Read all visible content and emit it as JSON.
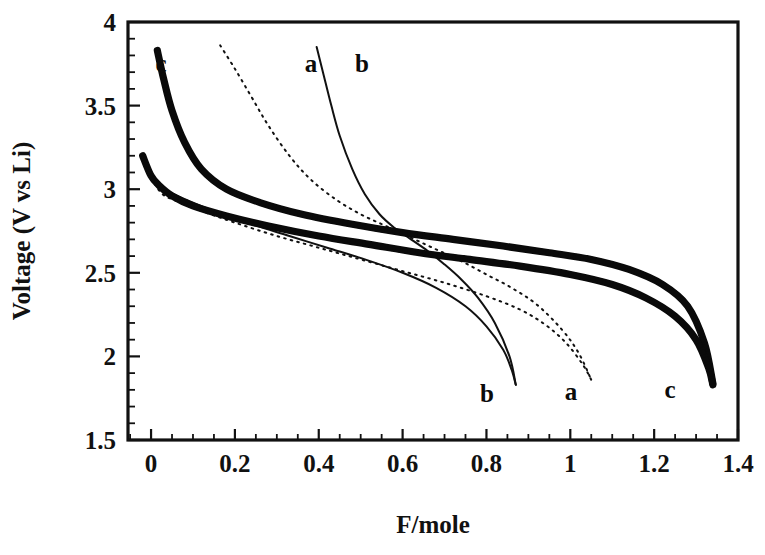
{
  "figure": {
    "title": "",
    "background": "#ffffff",
    "ink_color": "#111111"
  },
  "axes": {
    "x_title": "F/mole",
    "y_title": "Voltage (V vs Li)",
    "x_ticks": [
      "0",
      "0.2",
      "0.4",
      "0.6",
      "0.8",
      "1",
      "1.2",
      "1.4"
    ],
    "y_ticks": [
      "1.5",
      "2",
      "2.5",
      "3",
      "3.5",
      "4"
    ]
  },
  "curve_labels": {
    "c_top": "c",
    "a_top": "a",
    "b_top": "b",
    "b_bottom": "b",
    "a_bottom": "a",
    "c_bottom": "c"
  },
  "chart_data": {
    "type": "line",
    "title": "",
    "xlabel": "F/mole",
    "ylabel": "Voltage (V vs Li)",
    "xlim": [
      -0.055,
      1.4
    ],
    "ylim": [
      1.5,
      4.0
    ],
    "xticks": [
      0,
      0.2,
      0.4,
      0.6,
      0.8,
      1.0,
      1.2,
      1.4
    ],
    "yticks": [
      1.5,
      2.0,
      2.5,
      3.0,
      3.5,
      4.0
    ],
    "x_minor_step": 0.05,
    "y_minor_step": 0.1,
    "grid": false,
    "legend": "inline-curve-labels",
    "series": [
      {
        "name": "a-charge",
        "label": "a",
        "style": "dotted",
        "branch": "charge",
        "x": [
          0.165,
          0.2,
          0.24,
          0.28,
          0.33,
          0.38,
          0.44,
          0.5,
          0.56,
          0.62,
          0.68,
          0.74,
          0.8,
          0.86,
          0.92,
          0.98,
          1.02,
          1.05
        ],
        "y": [
          3.86,
          3.72,
          3.55,
          3.38,
          3.2,
          3.06,
          2.94,
          2.85,
          2.78,
          2.71,
          2.64,
          2.57,
          2.49,
          2.41,
          2.31,
          2.16,
          2.02,
          1.86
        ]
      },
      {
        "name": "a-discharge",
        "label": "a",
        "style": "dotted",
        "branch": "discharge",
        "x": [
          -0.02,
          0.02,
          0.06,
          0.12,
          0.2,
          0.3,
          0.4,
          0.5,
          0.6,
          0.7,
          0.8,
          0.88,
          0.94,
          0.99,
          1.03,
          1.05
        ],
        "y": [
          3.18,
          2.99,
          2.93,
          2.87,
          2.8,
          2.72,
          2.65,
          2.58,
          2.51,
          2.44,
          2.36,
          2.28,
          2.19,
          2.08,
          1.95,
          1.86
        ]
      },
      {
        "name": "b-charge",
        "label": "b",
        "style": "solid-thin",
        "branch": "charge",
        "x": [
          0.395,
          0.41,
          0.43,
          0.45,
          0.48,
          0.51,
          0.545,
          0.58,
          0.62,
          0.66,
          0.7,
          0.74,
          0.78,
          0.82,
          0.855,
          0.87
        ],
        "y": [
          3.85,
          3.7,
          3.5,
          3.32,
          3.12,
          2.97,
          2.85,
          2.77,
          2.7,
          2.63,
          2.55,
          2.46,
          2.35,
          2.2,
          2.0,
          1.83
        ]
      },
      {
        "name": "b-discharge",
        "label": "b",
        "style": "solid-thin",
        "branch": "discharge",
        "x": [
          -0.02,
          0.01,
          0.04,
          0.09,
          0.16,
          0.24,
          0.33,
          0.42,
          0.51,
          0.6,
          0.68,
          0.75,
          0.8,
          0.84,
          0.86,
          0.87
        ],
        "y": [
          3.21,
          3.06,
          2.99,
          2.93,
          2.86,
          2.79,
          2.72,
          2.65,
          2.58,
          2.5,
          2.41,
          2.3,
          2.18,
          2.04,
          1.92,
          1.83
        ]
      },
      {
        "name": "c-charge",
        "label": "c",
        "style": "thick-squares",
        "branch": "charge",
        "x": [
          0.015,
          0.03,
          0.05,
          0.08,
          0.12,
          0.18,
          0.26,
          0.36,
          0.48,
          0.6,
          0.72,
          0.84,
          0.95,
          1.05,
          1.14,
          1.22,
          1.28,
          1.32,
          1.34
        ],
        "y": [
          3.83,
          3.66,
          3.47,
          3.28,
          3.12,
          3.0,
          2.92,
          2.85,
          2.79,
          2.74,
          2.7,
          2.66,
          2.62,
          2.58,
          2.52,
          2.43,
          2.3,
          2.08,
          1.84
        ]
      },
      {
        "name": "c-discharge",
        "label": "c",
        "style": "thick-squares",
        "branch": "discharge",
        "x": [
          -0.02,
          0.0,
          0.02,
          0.05,
          0.1,
          0.18,
          0.28,
          0.4,
          0.52,
          0.64,
          0.76,
          0.88,
          1.0,
          1.1,
          1.18,
          1.25,
          1.3,
          1.33,
          1.34
        ],
        "y": [
          3.2,
          3.08,
          3.02,
          2.96,
          2.9,
          2.84,
          2.78,
          2.72,
          2.67,
          2.62,
          2.58,
          2.54,
          2.49,
          2.43,
          2.35,
          2.24,
          2.1,
          1.93,
          1.83
        ]
      }
    ]
  }
}
